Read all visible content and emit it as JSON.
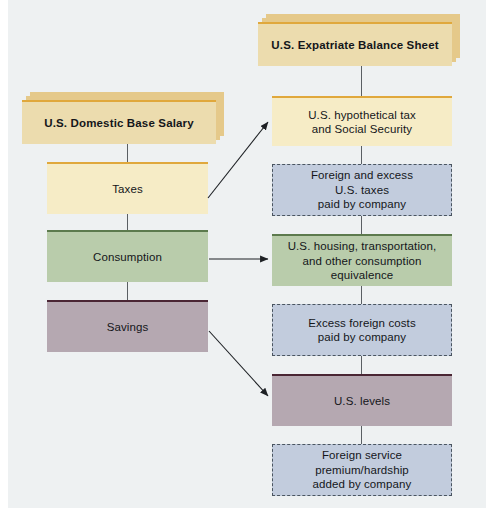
{
  "diagram": {
    "title_left": "U.S. Domestic Base Salary",
    "title_right": "U.S. Expatriate Balance Sheet",
    "colors": {
      "panel_background": "#eef1f2",
      "header_fill": "#ecdcae",
      "header_shadow": "#e5c98a",
      "header_stripe": "#e0a83c",
      "tax_fill": "#f6ecc6",
      "tax_stripe": "#e0a83c",
      "consumption_fill": "#b9ccab",
      "consumption_stripe": "#5c7a4d",
      "savings_fill": "#b5a8b1",
      "savings_stripe": "#4a2634",
      "dashed_fill": "#c2ccdd",
      "dashed_border": "#4a5560",
      "connector": "#5a5f63"
    },
    "left_column": {
      "header": "U.S. Domestic Base Salary",
      "items": [
        {
          "name": "taxes",
          "label": "Taxes",
          "style": "solid-tax"
        },
        {
          "name": "consumption",
          "label": "Consumption",
          "style": "solid-consumption"
        },
        {
          "name": "savings",
          "label": "Savings",
          "style": "solid-savings"
        }
      ]
    },
    "right_column": {
      "header": "U.S. Expatriate Balance Sheet",
      "items": [
        {
          "name": "hypothetical-tax",
          "label": "U.S. hypothetical tax and Social Security",
          "line1": "U.S. hypothetical tax",
          "line2": "and Social Security",
          "style": "solid-tax"
        },
        {
          "name": "foreign-excess-taxes",
          "label": "Foreign and excess U.S. taxes paid by company",
          "line1": "Foreign and excess",
          "line2": "U.S. taxes",
          "line3": "paid by company",
          "style": "dashed"
        },
        {
          "name": "housing-transportation",
          "label": "U.S. housing, transportation, and other consumption equivalence",
          "line1": "U.S. housing, transportation,",
          "line2": "and other consumption",
          "line3": "equivalence",
          "style": "solid-consumption"
        },
        {
          "name": "excess-foreign-costs",
          "label": "Excess foreign costs paid by company",
          "line1": "Excess foreign costs",
          "line2": "paid by company",
          "style": "dashed"
        },
        {
          "name": "us-levels",
          "label": "U.S. levels",
          "line1": "U.S. levels",
          "style": "solid-savings"
        },
        {
          "name": "foreign-service-premium",
          "label": "Foreign service premium/hardship added by company",
          "line1": "Foreign service",
          "line2": "premium/hardship",
          "line3": "added by company",
          "style": "dashed"
        }
      ]
    },
    "arrows": [
      {
        "name": "taxes-to-hypothetical-tax",
        "from": "taxes",
        "to": "hypothetical-tax"
      },
      {
        "name": "consumption-to-housing",
        "from": "consumption",
        "to": "housing-transportation"
      },
      {
        "name": "savings-to-us-levels",
        "from": "savings",
        "to": "us-levels"
      }
    ]
  }
}
